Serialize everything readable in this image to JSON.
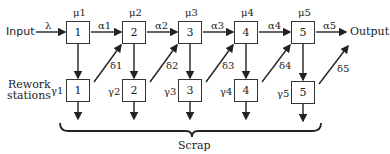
{
  "diagram": {
    "input_label": "Input",
    "output_label": "Output",
    "arrival_rate": "λ",
    "rework_label_line1": "Rework",
    "rework_label_line2": "stations",
    "scrap_label": "Scrap",
    "stations": [
      {
        "id": "1",
        "mu": "μ1",
        "alpha": "α1",
        "gamma": "γ1",
        "delta": "δ1"
      },
      {
        "id": "2",
        "mu": "μ2",
        "alpha": "α2",
        "gamma": "γ2",
        "delta": "δ2"
      },
      {
        "id": "3",
        "mu": "μ3",
        "alpha": "α3",
        "gamma": "γ3",
        "delta": "δ3"
      },
      {
        "id": "4",
        "mu": "μ4",
        "alpha": "α4",
        "gamma": "γ4",
        "delta": "δ4"
      },
      {
        "id": "5",
        "mu": "μ5",
        "alpha": "α5",
        "gamma": "γ5",
        "delta": "δ5"
      }
    ]
  }
}
